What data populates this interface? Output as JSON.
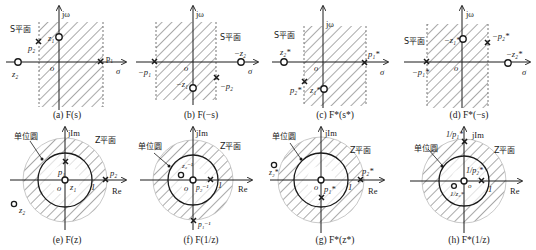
{
  "figure": {
    "s_plane_label": "S平面",
    "z_plane_label": "Z平面",
    "unit_circle_label": "单位圆",
    "axis_jw": "jω",
    "axis_sigma": "σ",
    "axis_jim": "jIm",
    "axis_re": "Re",
    "origin": "o",
    "unit_one": "1",
    "hatch_color": "#555555",
    "panels": [
      {
        "id": "a",
        "caption": "(a) F(s)",
        "labels": {
          "p1": "p₁",
          "p2": "p₂",
          "z1": "z₁",
          "z2": "z₂"
        }
      },
      {
        "id": "b",
        "caption": "(b) F(−s)",
        "labels": {
          "p1": "−p₁",
          "p2": "−p₂",
          "z1": "−z₁",
          "z2": "−z₂"
        }
      },
      {
        "id": "c",
        "caption": "(c) F*(s*)",
        "labels": {
          "p1": "p₁*",
          "p2": "p₂*",
          "z1": "z₁*",
          "z2": "z₂*"
        }
      },
      {
        "id": "d",
        "caption": "(d) F*(−s)",
        "labels": {
          "p1": "−p₁*",
          "p2": "−p₂*",
          "z1": "−z₁*",
          "z2": "−z₂*"
        }
      },
      {
        "id": "e",
        "caption": "(e) F(z)",
        "labels": {
          "p1": "p₁",
          "p2": "p₂",
          "z1": "z₁",
          "z2": "z₂"
        }
      },
      {
        "id": "f",
        "caption": "(f) F(1/z)",
        "labels": {
          "p1": "p₁⁻¹",
          "p2": "p₂⁻¹",
          "z2": "z₂⁻¹"
        }
      },
      {
        "id": "g",
        "caption": "(g) F*(z*)",
        "labels": {
          "p1": "p₁*",
          "p2": "p₂*",
          "z2": "z₂*"
        }
      },
      {
        "id": "h",
        "caption": "(h) F*(1/z)",
        "labels": {
          "p1": "1/p₁*",
          "p2": "1/p₂*",
          "z2": "1/z₂*"
        }
      }
    ]
  }
}
